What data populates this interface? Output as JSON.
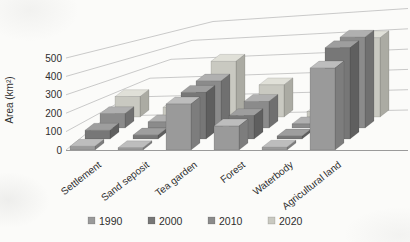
{
  "figure": {
    "background": "#fbfbf9",
    "text_color": "#2e2e2e",
    "gridline_color": "#bcbcbc",
    "axis_line_color": "#9a9a9a"
  },
  "chart_data": {
    "type": "bar",
    "projection": "3d",
    "title": "",
    "xlabel": "",
    "ylabel": "Area (km²)",
    "ylim": [
      0,
      500
    ],
    "yticks": [
      0,
      100,
      200,
      300,
      400,
      500
    ],
    "grid": true,
    "legend_position": "bottom",
    "categories": [
      "Settlement",
      "Sand seposit",
      "Tea garden",
      "Forest",
      "Waterbody",
      "Agricultural land"
    ],
    "series": [
      {
        "name": "1990",
        "values": [
          20,
          12,
          250,
          130,
          15,
          445
        ],
        "color": {
          "front": "#9a9a9a",
          "top": "#bdbdbd",
          "side": "#7d7d7d"
        }
      },
      {
        "name": "2000",
        "values": [
          45,
          20,
          240,
          120,
          15,
          470
        ],
        "color": {
          "front": "#777777",
          "top": "#9e9e9e",
          "side": "#5f5f5f"
        }
      },
      {
        "name": "2010",
        "values": [
          70,
          30,
          230,
          130,
          20,
          445
        ],
        "color": {
          "front": "#8b8b8b",
          "top": "#b0b0b0",
          "side": "#707070"
        }
      },
      {
        "name": "2020",
        "values": [
          95,
          45,
          260,
          150,
          25,
          370
        ],
        "color": {
          "front": "#c9c9c1",
          "top": "#e0e0d8",
          "side": "#ababa3"
        }
      }
    ]
  }
}
